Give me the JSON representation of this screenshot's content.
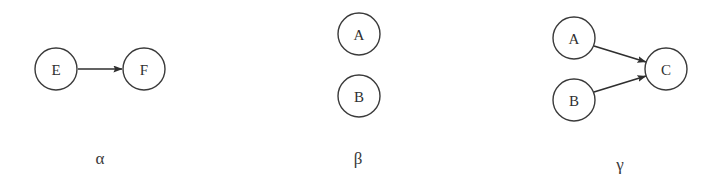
{
  "figure": {
    "background_color": "#ffffff",
    "stroke_color": "#2f2f2f",
    "node_stroke_color": "#3a3a3a",
    "node_fill_color": "#ffffff",
    "panel_count": 3
  },
  "panels": [
    {
      "id": "alpha",
      "caption": "α",
      "caption_x": 100,
      "caption_y": 164,
      "nodes": [
        {
          "id": "E",
          "label": "E",
          "cx": 56,
          "cy": 69,
          "r": 21
        },
        {
          "id": "F",
          "label": "F",
          "cx": 144,
          "cy": 69,
          "r": 21
        }
      ],
      "edges": [
        {
          "from": "E",
          "to": "F",
          "x1": 78,
          "y1": 69,
          "x2": 122,
          "y2": 69
        }
      ]
    },
    {
      "id": "beta",
      "caption": "β",
      "caption_x": 358,
      "caption_y": 164,
      "nodes": [
        {
          "id": "A",
          "label": "A",
          "cx": 359,
          "cy": 34,
          "r": 21
        },
        {
          "id": "B",
          "label": "B",
          "cx": 359,
          "cy": 96,
          "r": 21
        }
      ],
      "edges": []
    },
    {
      "id": "gamma",
      "caption": "γ",
      "caption_x": 620,
      "caption_y": 170,
      "nodes": [
        {
          "id": "A",
          "label": "A",
          "cx": 574,
          "cy": 38,
          "r": 21
        },
        {
          "id": "B",
          "label": "B",
          "cx": 574,
          "cy": 100,
          "r": 21
        },
        {
          "id": "C",
          "label": "C",
          "cx": 666,
          "cy": 69,
          "r": 21
        }
      ],
      "edges": [
        {
          "from": "A",
          "to": "C",
          "x1": 594,
          "y1": 46,
          "x2": 646,
          "y2": 62
        },
        {
          "from": "B",
          "to": "C",
          "x1": 594,
          "y1": 92,
          "x2": 646,
          "y2": 76
        }
      ]
    }
  ]
}
